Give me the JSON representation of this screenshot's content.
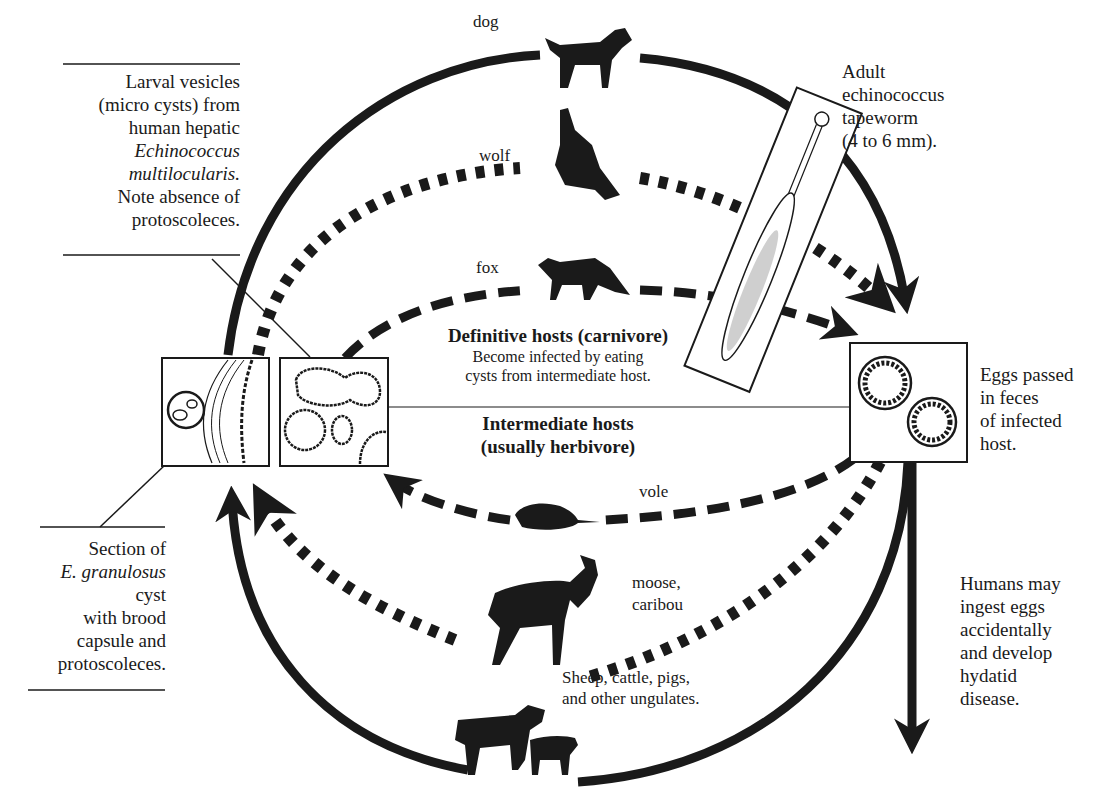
{
  "diagram": {
    "colors": {
      "ink": "#1a1a1a",
      "background": "#ffffff"
    }
  },
  "hosts": {
    "dog": "dog",
    "wolf": "wolf",
    "fox": "fox",
    "vole": "vole",
    "moose": "moose,",
    "caribou": "caribou"
  },
  "definitive": {
    "heading": "Definitive hosts  (carnivore)",
    "line1": "Become infected by eating",
    "line2": "cysts from intermediate host."
  },
  "intermediate": {
    "heading1": "Intermediate hosts",
    "heading2": "(usually herbivore)"
  },
  "ungulates": {
    "line1": "Sheep, cattle, pigs,",
    "line2": "and other ungulates."
  },
  "larval_note": {
    "l1": "Larval vesicles",
    "l2": "(micro cysts) from",
    "l3": "human hepatic",
    "l4": "Echinococcus",
    "l5": "multilocularis.",
    "l6": "Note absence of",
    "l7": "protoscoleces."
  },
  "section_note": {
    "l1": "Section of",
    "l2": "E. granulosus",
    "l3": "cyst",
    "l4": "with brood",
    "l5": "capsule and",
    "l6": "protoscoleces."
  },
  "adult_note": {
    "l1": "Adult",
    "l2": "echinococcus",
    "l3": "tapeworm",
    "l4": "(4 to 6 mm)."
  },
  "eggs_note": {
    "l1": "Eggs passed",
    "l2": "in feces",
    "l3": "of infected",
    "l4": "host."
  },
  "humans_note": {
    "l1": "Humans may",
    "l2": "ingest eggs",
    "l3": "accidentally",
    "l4": "and develop",
    "l5": "hydatid",
    "l6": "disease."
  }
}
